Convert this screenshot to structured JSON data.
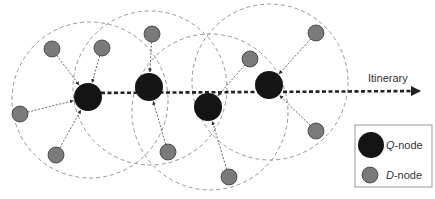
{
  "diagram": {
    "itinerary_label": "Itinerary",
    "legend": {
      "q_node": {
        "prefix": "Q",
        "suffix": "-node"
      },
      "d_node": {
        "prefix": "D",
        "suffix": "-node"
      }
    },
    "colors": {
      "q_node_fill": "#141414",
      "d_node_fill": "#7a7a7a",
      "d_node_stroke": "#3a3a3a",
      "range_circle": "#8a8a8a",
      "arrow": "#444444",
      "itinerary": "#222222",
      "legend_border": "#999999"
    },
    "q_nodes": [
      {
        "id": "Q1",
        "x": 88,
        "y": 97
      },
      {
        "id": "Q2",
        "x": 149,
        "y": 87
      },
      {
        "id": "Q3",
        "x": 208,
        "y": 107
      },
      {
        "id": "Q4",
        "x": 269,
        "y": 85
      }
    ],
    "d_nodes": [
      {
        "x": 52,
        "y": 49,
        "target": "Q1"
      },
      {
        "x": 102,
        "y": 48,
        "target": "Q1"
      },
      {
        "x": 20,
        "y": 114,
        "target": "Q1"
      },
      {
        "x": 56,
        "y": 155,
        "target": "Q1"
      },
      {
        "x": 152,
        "y": 34,
        "target": "Q2"
      },
      {
        "x": 168,
        "y": 152,
        "target": "Q2"
      },
      {
        "x": 250,
        "y": 59,
        "target": "Q3"
      },
      {
        "x": 229,
        "y": 177,
        "target": "Q3"
      },
      {
        "x": 316,
        "y": 33,
        "target": "Q4"
      },
      {
        "x": 316,
        "y": 131,
        "target": "Q4"
      }
    ],
    "range_circles": [
      {
        "cx": 90,
        "cy": 100,
        "r": 78
      },
      {
        "cx": 150,
        "cy": 88,
        "r": 77
      },
      {
        "cx": 210,
        "cy": 112,
        "r": 78
      },
      {
        "cx": 270,
        "cy": 82,
        "r": 78
      }
    ]
  }
}
